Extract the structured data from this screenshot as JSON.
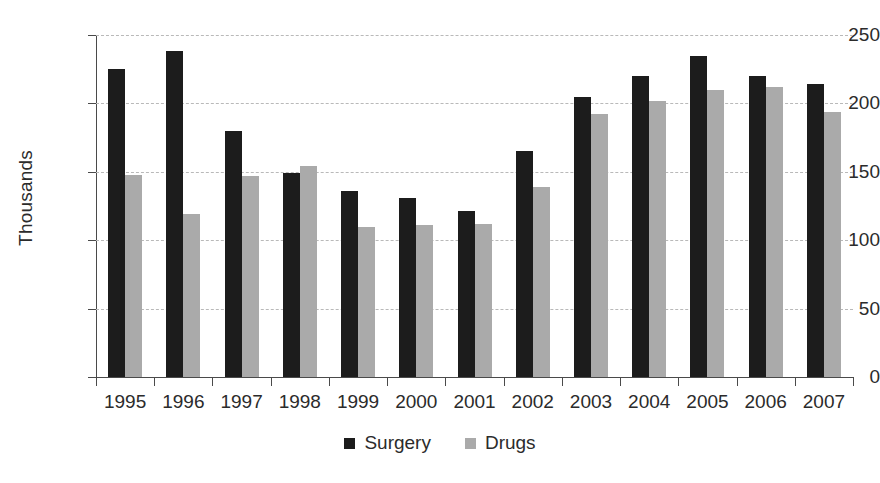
{
  "chart_data": {
    "type": "bar",
    "title": "",
    "xlabel": "",
    "ylabel": "Thousands",
    "ylim": [
      0,
      250
    ],
    "yticks": [
      0,
      50,
      100,
      150,
      200,
      250
    ],
    "grid": true,
    "legend_position": "bottom",
    "categories": [
      "1995",
      "1996",
      "1997",
      "1998",
      "1999",
      "2000",
      "2001",
      "2002",
      "2003",
      "2004",
      "2005",
      "2006",
      "2007"
    ],
    "series": [
      {
        "name": "Surgery",
        "color": "#1c1c1c",
        "values": [
          225,
          238,
          180,
          149,
          136,
          131,
          121,
          165,
          205,
          220,
          235,
          220,
          214
        ]
      },
      {
        "name": "Drugs",
        "color": "#aaaaaa",
        "values": [
          148,
          119,
          147,
          154,
          110,
          111,
          112,
          139,
          192,
          202,
          210,
          212,
          194
        ]
      }
    ]
  },
  "axis": {
    "y_title": "Thousands",
    "y_tick_labels": [
      "250",
      "200",
      "150",
      "100",
      "50",
      "0"
    ],
    "x_tick_labels": [
      "1995",
      "1996",
      "1997",
      "1998",
      "1999",
      "2000",
      "2001",
      "2002",
      "2003",
      "2004",
      "2005",
      "2006",
      "2007"
    ]
  },
  "legend": {
    "items": [
      {
        "label": "Surgery",
        "color": "#1c1c1c"
      },
      {
        "label": "Drugs",
        "color": "#aaaaaa"
      }
    ]
  }
}
